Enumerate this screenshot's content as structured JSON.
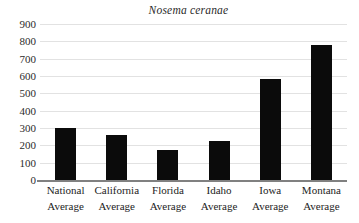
{
  "chart_data": {
    "type": "bar",
    "title": "Nosema ceranae",
    "xlabel": "",
    "ylabel": "",
    "ylim": [
      0,
      900
    ],
    "ytick_step": 100,
    "yticks": [
      "900",
      "800",
      "700",
      "600",
      "500",
      "400",
      "300",
      "200",
      "100",
      "0"
    ],
    "grid": true,
    "legend": false,
    "categories": [
      "National Average",
      "California Average",
      "Florida Average",
      "Idaho Average",
      "Iowa Average",
      "Montana Average"
    ],
    "category_lines": [
      {
        "line1": "National",
        "line2": "Average"
      },
      {
        "line1": "California",
        "line2": "Average"
      },
      {
        "line1": "Florida",
        "line2": "Average"
      },
      {
        "line1": "Idaho",
        "line2": "Average"
      },
      {
        "line1": "Iowa",
        "line2": "Average"
      },
      {
        "line1": "Montana",
        "line2": "Average"
      }
    ],
    "values": [
      300,
      260,
      175,
      225,
      580,
      780
    ],
    "bar_color": "#0b0b0b",
    "grid_color": "#e2e2e2",
    "axis_color": "#808080"
  }
}
